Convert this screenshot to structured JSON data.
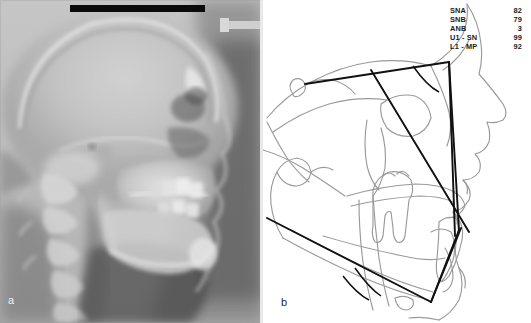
{
  "figure": {
    "panels": [
      {
        "id": "a",
        "label": "a",
        "caption": "lateral cephalometric radiograph"
      },
      {
        "id": "b",
        "label": "b",
        "caption": "cephalometric tracing"
      }
    ]
  },
  "panel_a": {
    "label": "a",
    "markers": {
      "film_bar": "black-reference-bar",
      "ear_rod": "ear-rod-marker"
    }
  },
  "panel_b": {
    "label": "b",
    "measurements": {
      "rows": [
        {
          "name": "SNA",
          "value": "82"
        },
        {
          "name": "SNB",
          "value": "79"
        },
        {
          "name": "ANB",
          "value": "3"
        },
        {
          "name": "U1 - SN",
          "value": "99"
        },
        {
          "name": "L1 - MP",
          "value": "92"
        }
      ]
    },
    "colors": {
      "outline": "#9a9a9a",
      "measurement_line": "#111111",
      "background": "#ffffff"
    }
  }
}
